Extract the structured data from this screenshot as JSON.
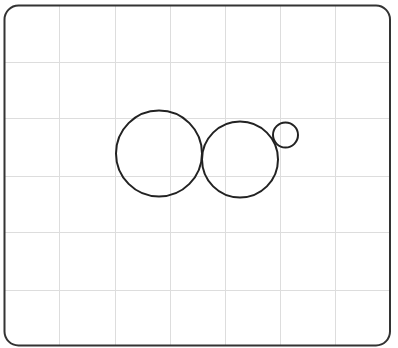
{
  "diagram": {
    "type": "circles-on-grid",
    "background": "#ffffff",
    "frame": {
      "x": 4.5,
      "y": 5.5,
      "width": 385.5,
      "height": 340,
      "radius": 14,
      "stroke": "#333333",
      "stroke_width": 2
    },
    "grid": {
      "color": "#dddddd",
      "vertical_lines": [
        59,
        115,
        170,
        225,
        280,
        335
      ],
      "horizontal_lines": [
        62,
        118,
        176,
        232,
        290
      ]
    },
    "circles": [
      {
        "name": "large-circle",
        "cx": 159,
        "cy": 153.5,
        "r": 43,
        "stroke": "#222222",
        "stroke_width": 2
      },
      {
        "name": "medium-circle",
        "cx": 240,
        "cy": 159.5,
        "r": 38,
        "stroke": "#222222",
        "stroke_width": 2
      },
      {
        "name": "small-circle",
        "cx": 285.5,
        "cy": 135,
        "r": 12.5,
        "stroke": "#222222",
        "stroke_width": 2
      }
    ]
  }
}
